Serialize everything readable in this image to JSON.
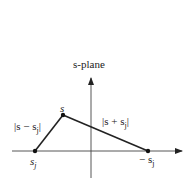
{
  "diagram": {
    "title": "s-plane",
    "colors": {
      "stroke": "#222222",
      "axis": "#444444",
      "background": "#ffffff"
    },
    "axes": {
      "horizontal": {
        "x1": 12,
        "x2": 182,
        "y": 151
      },
      "vertical": {
        "x": 91,
        "y1": 178,
        "y2": 78
      }
    },
    "points": [
      {
        "id": "s",
        "label": "s",
        "x": 63,
        "y": 115
      },
      {
        "id": "s_j",
        "label": "s",
        "subscript": "j",
        "x": 35,
        "y": 151
      },
      {
        "id": "neg_s_j",
        "label": "− s",
        "subscript": "j",
        "x": 148,
        "y": 151
      }
    ],
    "segments": [
      {
        "from": "s_j",
        "to": "s",
        "label": "|s − s",
        "label_sub": "j",
        "label_end": "|"
      },
      {
        "from": "s",
        "to": "neg_s_j",
        "label": "|s + s",
        "label_sub": "j",
        "label_end": "|"
      }
    ],
    "labels": {
      "s": "s",
      "diff_main": "|s − s",
      "diff_sub": "j",
      "diff_end": "|",
      "sum_main": "|s + s",
      "sum_sub": "j",
      "sum_end": "|",
      "sj_main": "s",
      "sj_sub": "j",
      "negsj_main": "− s",
      "negsj_sub": "j"
    }
  }
}
